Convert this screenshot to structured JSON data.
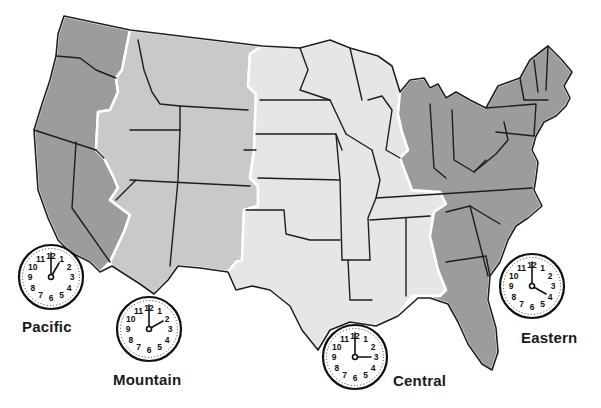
{
  "map": {
    "title": "US Time Zones",
    "colors": {
      "pacific": "#9c9c9c",
      "mountain": "#c9c9c9",
      "central": "#e6e6e6",
      "eastern": "#9c9c9c",
      "boundary": "#ffffff",
      "state_line": "#1e1e1e"
    }
  },
  "zones": [
    {
      "name": "Pacific",
      "hour": 1,
      "minute": 0,
      "time": "1:00"
    },
    {
      "name": "Mountain",
      "hour": 2,
      "minute": 0,
      "time": "2:00"
    },
    {
      "name": "Central",
      "hour": 3,
      "minute": 0,
      "time": "3:00"
    },
    {
      "name": "Eastern",
      "hour": 4,
      "minute": 0,
      "time": "4:00"
    }
  ],
  "clock_numbers": [
    "12",
    "1",
    "2",
    "3",
    "4",
    "5",
    "6",
    "7",
    "8",
    "9",
    "10",
    "11"
  ]
}
